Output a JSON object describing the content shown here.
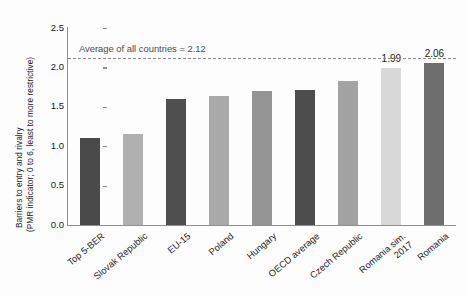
{
  "chart": {
    "ylabel_line1": "Barriers to entry and rivalry",
    "ylabel_line2": "(PMR indicator; 0 to 6, least to more restrictive)",
    "average_annotation": "Average of all countries = 2.12"
  },
  "chart_data": {
    "type": "bar",
    "title": "",
    "xlabel": "",
    "ylabel": "Barriers to entry and rivalry (PMR indicator; 0 to 6, least to more restrictive)",
    "ylim": [
      0.0,
      2.5
    ],
    "yticks": [
      "0.0",
      "0.5",
      "1.0",
      "1.5",
      "2.0",
      "2.5"
    ],
    "ytick_values": [
      0.0,
      0.5,
      1.0,
      1.5,
      2.0,
      2.5
    ],
    "grid": false,
    "legend": "none",
    "categories": [
      "Top 5-BER",
      "Slovak Republic",
      "EU-15",
      "Poland",
      "Hungary",
      "OECD average",
      "Czech Republic",
      "Romania sim. 2017",
      "Romania"
    ],
    "category_lines": [
      [
        "Top 5-BER"
      ],
      [
        "Slovak Republic"
      ],
      [
        "EU-15"
      ],
      [
        "Poland"
      ],
      [
        "Hungary"
      ],
      [
        "OECD average"
      ],
      [
        "Czech Republic"
      ],
      [
        "Romania sim.",
        "2017"
      ],
      [
        "Romania"
      ]
    ],
    "values": [
      1.1,
      1.15,
      1.6,
      1.64,
      1.7,
      1.71,
      1.83,
      1.99,
      2.06
    ],
    "value_labels": [
      "",
      "",
      "",
      "",
      "",
      "",
      "",
      "1.99",
      "2.06"
    ],
    "bar_colors": [
      "#4a4a4a",
      "#b0b0b0",
      "#4f4f4f",
      "#a9a9a9",
      "#949494",
      "#4d4d4d",
      "#a3a3a3",
      "#d8d8d8",
      "#6e6e6e"
    ],
    "annotations": [
      {
        "type": "hline",
        "label": "Average of all countries = 2.12",
        "value": 2.12,
        "style": "dashed",
        "color": "#8a8a8a"
      }
    ]
  }
}
